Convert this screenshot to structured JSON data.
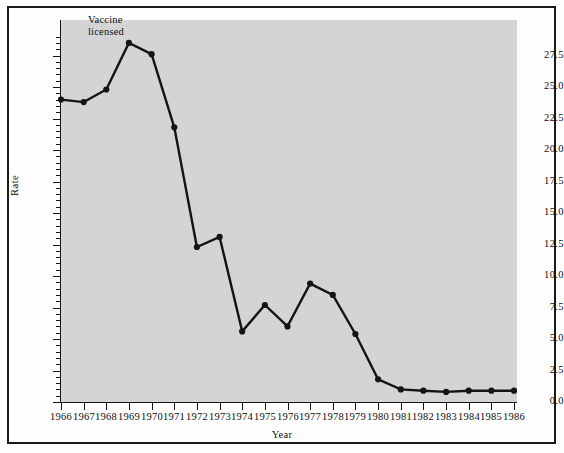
{
  "chart_data": {
    "type": "line",
    "title": "",
    "xlabel": "Year",
    "ylabel": "Rate",
    "xlim": [
      1966,
      1986
    ],
    "ylim": [
      0.0,
      29.5
    ],
    "grid": false,
    "legend": null,
    "categories": [
      1966,
      1967,
      1968,
      1969,
      1970,
      1971,
      1972,
      1973,
      1974,
      1975,
      1976,
      1977,
      1978,
      1979,
      1980,
      1981,
      1982,
      1983,
      1984,
      1985,
      1986
    ],
    "values": [
      24.0,
      23.8,
      24.8,
      28.5,
      27.6,
      21.8,
      12.3,
      13.1,
      5.6,
      7.7,
      6.0,
      9.4,
      8.5,
      5.4,
      1.8,
      1.0,
      0.9,
      0.8,
      0.9,
      0.9,
      0.9
    ],
    "series": [
      {
        "name": "Rate",
        "values": [
          24.0,
          23.8,
          24.8,
          28.5,
          27.6,
          21.8,
          12.3,
          13.1,
          5.6,
          7.7,
          6.0,
          9.4,
          8.5,
          5.4,
          1.8,
          1.0,
          0.9,
          0.8,
          0.9,
          0.9,
          0.9
        ]
      }
    ],
    "ytick_labels": [
      "0.0",
      "2.5",
      "5.0",
      "7.5",
      "10.0",
      "12.5",
      "15.0",
      "17.5",
      "20.0",
      "22.5",
      "25.0",
      "27.5"
    ],
    "ytick_values": [
      0.0,
      2.5,
      5.0,
      7.5,
      10.0,
      12.5,
      15.0,
      17.5,
      20.0,
      22.5,
      25.0,
      27.5
    ],
    "xtick_labels": [
      "1966",
      "1967",
      "1968",
      "1969",
      "1970",
      "1971",
      "1972",
      "1973",
      "1974",
      "1975",
      "1976",
      "1977",
      "1978",
      "1979",
      "1980",
      "1981",
      "1982",
      "1983",
      "1984",
      "1985",
      "1986"
    ],
    "annotations": [
      {
        "text": "Vaccine\nlicensed",
        "x": 1969,
        "y": 29.0
      }
    ],
    "colors": {
      "line": "#141414",
      "marker": "#141414",
      "plot_background": "#d4d4d4",
      "figure_background": "#fdfdfd",
      "axis": "#141414",
      "frame": "#1a1a1a"
    }
  }
}
